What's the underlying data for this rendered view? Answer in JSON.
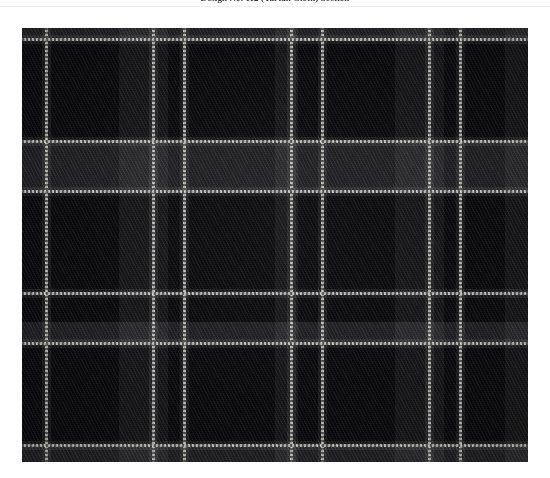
{
  "caption": {
    "text": "Design No. 112 (Tartan Cloth) Section"
  },
  "swatch": {
    "name": "tartan-plaid-swatch",
    "alt_label": "Dark tartan plaid fabric swatch",
    "colors": {
      "ground": "#0c0c0e",
      "block_dark": "#0a0a0c",
      "block_mid": "#171719",
      "band_charcoal": "#26262a",
      "overcheck_white": "#cfcfcb",
      "page_background": "#ffffff"
    },
    "geometry": {
      "left": 22,
      "top": 28,
      "width": 506,
      "height": 434
    },
    "vertical_overcheck_x": [
      23,
      130,
      161,
      268,
      299,
      406,
      437
    ],
    "horizontal_overcheck_y": [
      10,
      112,
      162,
      264,
      314,
      416
    ],
    "vertical_glow_x": [
      20,
      127,
      158,
      265,
      296,
      403,
      434
    ],
    "horizontal_glow_y": [
      7,
      109,
      159,
      261,
      311,
      413
    ]
  }
}
